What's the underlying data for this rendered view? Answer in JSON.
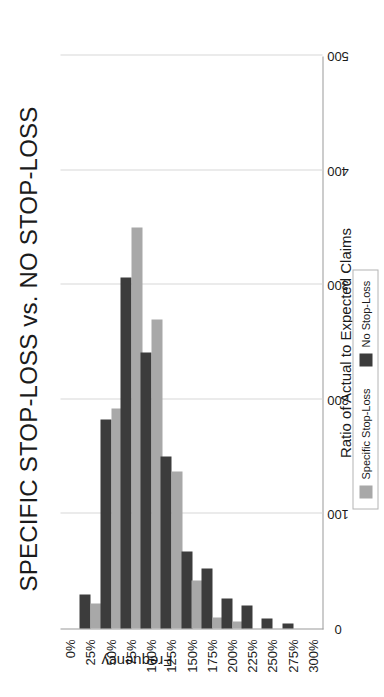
{
  "chart_data": {
    "type": "bar",
    "title": "SPECIFIC STOP-LOSS vs. NO STOP-LOSS",
    "xlabel": "Ratio of Actual to Expected Claims",
    "ylabel": "Frequency",
    "orientation": "vertical",
    "categories": [
      "0%",
      "25%",
      "50%",
      "75%",
      "100%",
      "125%",
      "150%",
      "175%",
      "200%",
      "225%",
      "250%",
      "275%",
      "300%"
    ],
    "ylim": [
      0,
      500
    ],
    "yticks": [
      0,
      100,
      200,
      300,
      400,
      500
    ],
    "ytick_labels": [
      "0",
      "100",
      "200",
      "300",
      "400",
      "500"
    ],
    "grid": true,
    "legend_position": "bottom",
    "series": [
      {
        "name": "Specific Stop-Loss",
        "color": "#a8a8a8",
        "values": [
          0,
          22,
          192,
          350,
          270,
          137,
          42,
          10,
          6,
          0,
          0,
          0,
          0
        ]
      },
      {
        "name": "No Stop-Loss",
        "color": "#3c3c3c",
        "values": [
          0,
          30,
          182,
          306,
          241,
          150,
          67,
          52,
          26,
          20,
          9,
          4,
          0
        ]
      }
    ]
  },
  "legend": {
    "items": [
      {
        "label": "Specific Stop-Loss",
        "swatch": "light-gray-swatch-icon"
      },
      {
        "label": "No Stop-Loss",
        "swatch": "dark-gray-swatch-icon"
      }
    ]
  }
}
